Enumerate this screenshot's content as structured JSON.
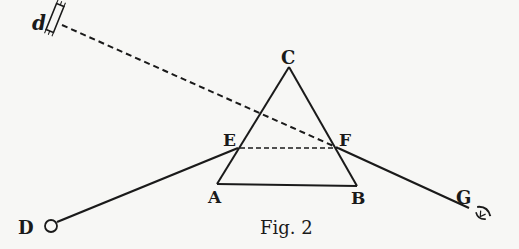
{
  "figure": {
    "caption": "Fig. 2",
    "labels": {
      "d": "d",
      "C": "C",
      "E": "E",
      "F": "F",
      "A": "A",
      "B": "B",
      "D": "D",
      "G": "G"
    },
    "elements": {
      "prism": "triangle ABC",
      "mirror": "small mirror d",
      "object": "circle at D",
      "observer": "eye at G"
    },
    "colors": {
      "ink": "#1a1a1a",
      "paper": "#f7f7f5"
    }
  }
}
